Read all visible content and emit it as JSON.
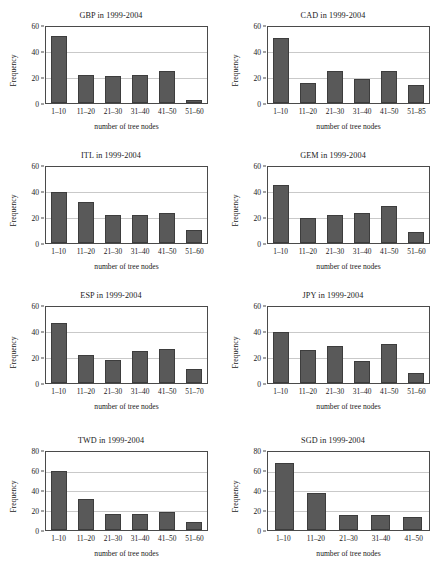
{
  "figure": {
    "axis_label_y": "Frequency",
    "axis_label_x": "number of tree nodes",
    "bar_color": "#595959",
    "bar_border_color": "#3d3d3d",
    "gridline_color": "#c9c9c9",
    "axis_color": "#4a4a4a",
    "background": "#ffffff"
  },
  "chart_data": [
    {
      "type": "bar",
      "title": "GBP in 1999-2004",
      "xlabel": "number of tree nodes",
      "ylabel": "Frequency",
      "categories": [
        "1–10",
        "11–20",
        "21–30",
        "31–40",
        "41–50",
        "51–60"
      ],
      "values": [
        53,
        22,
        21,
        22,
        25,
        2
      ],
      "ylim": [
        0,
        60
      ],
      "yticks": [
        0,
        20,
        40,
        60
      ],
      "grid": true
    },
    {
      "type": "bar",
      "title": "CAD in 1999-2004",
      "xlabel": "number of tree nodes",
      "ylabel": "Frequency",
      "categories": [
        "1–10",
        "11–20",
        "21–30",
        "31–40",
        "41–50",
        "51–85"
      ],
      "values": [
        51,
        16,
        25,
        19,
        25,
        14
      ],
      "ylim": [
        0,
        60
      ],
      "yticks": [
        0,
        20,
        40,
        60
      ],
      "grid": true
    },
    {
      "type": "bar",
      "title": "ITL in 1999-2004",
      "xlabel": "number of tree nodes",
      "ylabel": "Frequency",
      "categories": [
        "1–10",
        "11–20",
        "21–30",
        "31–40",
        "41–50",
        "51–60"
      ],
      "values": [
        40,
        32,
        22,
        22,
        24,
        10
      ],
      "ylim": [
        0,
        60
      ],
      "yticks": [
        0,
        20,
        40,
        60
      ],
      "grid": true
    },
    {
      "type": "bar",
      "title": "GEM in 1999-2004",
      "xlabel": "number of tree nodes",
      "ylabel": "Frequency",
      "categories": [
        "1–10",
        "11–20",
        "21–30",
        "31–40",
        "41–50",
        "51–60"
      ],
      "values": [
        46,
        20,
        22,
        24,
        29,
        9
      ],
      "ylim": [
        0,
        60
      ],
      "yticks": [
        0,
        20,
        40,
        60
      ],
      "grid": true
    },
    {
      "type": "bar",
      "title": "ESP in 1999-2004",
      "xlabel": "number of tree nodes",
      "ylabel": "Frequency",
      "categories": [
        "1–10",
        "11–20",
        "21–30",
        "31–40",
        "41–50",
        "51–70"
      ],
      "values": [
        47,
        22,
        18,
        25,
        27,
        11
      ],
      "ylim": [
        0,
        60
      ],
      "yticks": [
        0,
        20,
        40,
        60
      ],
      "grid": true
    },
    {
      "type": "bar",
      "title": "JPY in 1999-2004",
      "xlabel": "number of tree nodes",
      "ylabel": "Frequency",
      "categories": [
        "1–10",
        "11–20",
        "21–30",
        "31–40",
        "41–50",
        "51–60"
      ],
      "values": [
        40,
        26,
        29,
        17,
        31,
        8
      ],
      "ylim": [
        0,
        60
      ],
      "yticks": [
        0,
        20,
        40,
        60
      ],
      "grid": true
    },
    {
      "type": "bar",
      "title": "TWD in 1999-2004",
      "xlabel": "number of tree nodes",
      "ylabel": "Frequency",
      "categories": [
        "1–10",
        "11–20",
        "21–30",
        "31–40",
        "41–50",
        "51–60"
      ],
      "values": [
        61,
        32,
        16,
        16,
        18,
        8
      ],
      "ylim": [
        0,
        80
      ],
      "yticks": [
        0,
        20,
        40,
        60,
        80
      ],
      "grid": true
    },
    {
      "type": "bar",
      "title": "SGD in 1999-2004",
      "xlabel": "number of tree nodes",
      "ylabel": "Frequency",
      "categories": [
        "1–10",
        "11–20",
        "21–30",
        "31–40",
        "41–50"
      ],
      "values": [
        69,
        38,
        15,
        15,
        13
      ],
      "ylim": [
        0,
        80
      ],
      "yticks": [
        0,
        20,
        40,
        60,
        80
      ],
      "grid": true
    }
  ]
}
